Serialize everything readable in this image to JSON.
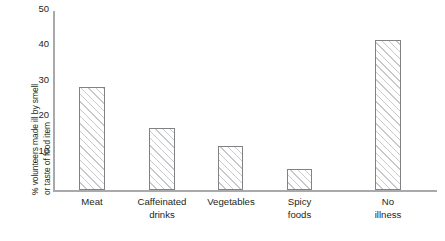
{
  "chart_data": {
    "type": "bar",
    "title": "",
    "xlabel": "",
    "ylabel": "% volunteers made ill by smell\nor taste of food item",
    "categories": [
      "Meat",
      "Caffeinated\ndrinks",
      "Vegetables",
      "Spicy\nfoods",
      "No\nillness"
    ],
    "values": [
      30,
      18,
      13,
      6,
      44
    ],
    "ylim": [
      0,
      50
    ],
    "yticks": [
      10,
      20,
      30,
      40,
      50
    ],
    "ytick_labels": [
      "10",
      "20",
      "30",
      "40",
      "50"
    ],
    "grid": false,
    "legend": null,
    "bar_style": {
      "fill": "diagonal-hatch",
      "hatch_color": "#c8c9cb",
      "edge_color": "#808285",
      "background": "#ffffff"
    },
    "axis_color": "#a7a9ac",
    "text_color": "#231f20"
  }
}
